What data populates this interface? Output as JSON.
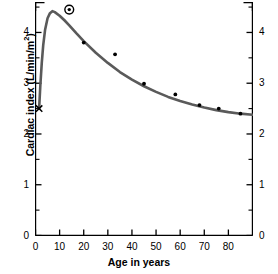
{
  "chart_data": {
    "type": "scatter",
    "title": "",
    "xlabel": "Age in years",
    "ylabel": "Cardiac index (L/min/m²)",
    "ylabel_base": "Cardiac index (L/min/m",
    "ylabel_exp": "2",
    "ylabel_tail": ")",
    "xlim": [
      0,
      90
    ],
    "ylim": [
      0,
      4.6
    ],
    "grid": false,
    "legend": "none",
    "x_ticks": [
      0,
      10,
      20,
      30,
      40,
      50,
      60,
      70,
      80
    ],
    "x_tick_labels": [
      "0",
      "10",
      "20",
      "30",
      "40",
      "50",
      "60",
      "70",
      "80"
    ],
    "x_minor_ticks": [
      5,
      15,
      25,
      35,
      45,
      55,
      65,
      75,
      85
    ],
    "y_ticks": [
      0,
      1,
      2,
      3,
      4
    ],
    "y_tick_labels": [
      "0",
      "1",
      "2",
      "3",
      "4"
    ],
    "y_minor_ticks": [
      0.5,
      1.5,
      2.5,
      3.5,
      4.5
    ],
    "right_axis_ticks": [
      0,
      1,
      2,
      3,
      4
    ],
    "right_axis_tick_labels": [
      "0",
      "1",
      "2",
      "3",
      "4"
    ],
    "series": [
      {
        "name": "Measured cardiac index",
        "marker": "filled-dot",
        "color": "#000000",
        "points": [
          {
            "x": 20,
            "y": 3.8
          },
          {
            "x": 33,
            "y": 3.57
          },
          {
            "x": 45,
            "y": 2.99
          },
          {
            "x": 58,
            "y": 2.78
          },
          {
            "x": 68,
            "y": 2.57
          },
          {
            "x": 76,
            "y": 2.5
          },
          {
            "x": 85,
            "y": 2.4
          }
        ]
      },
      {
        "name": "Birth value",
        "marker": "x-cross",
        "color": "#000000",
        "points": [
          {
            "x": 1.5,
            "y": 2.5
          }
        ]
      },
      {
        "name": "Highlighted peak value",
        "marker": "circled-dot",
        "color": "#000000",
        "points": [
          {
            "x": 14,
            "y": 4.45
          }
        ]
      }
    ],
    "fitted_curve": {
      "name": "Fitted cardiac index curve",
      "color": "#5a5a5a",
      "width": 2.6,
      "points": [
        {
          "x": 1.5,
          "y": 2.5
        },
        {
          "x": 2.0,
          "y": 2.95
        },
        {
          "x": 2.6,
          "y": 3.4
        },
        {
          "x": 3.2,
          "y": 3.75
        },
        {
          "x": 4.0,
          "y": 4.06
        },
        {
          "x": 5.0,
          "y": 4.28
        },
        {
          "x": 6.0,
          "y": 4.38
        },
        {
          "x": 7.0,
          "y": 4.42
        },
        {
          "x": 8.0,
          "y": 4.4
        },
        {
          "x": 10.0,
          "y": 4.33
        },
        {
          "x": 12.0,
          "y": 4.24
        },
        {
          "x": 14.0,
          "y": 4.14
        },
        {
          "x": 17.0,
          "y": 3.98
        },
        {
          "x": 20.0,
          "y": 3.83
        },
        {
          "x": 25.0,
          "y": 3.6
        },
        {
          "x": 30.0,
          "y": 3.4
        },
        {
          "x": 35.0,
          "y": 3.22
        },
        {
          "x": 40.0,
          "y": 3.07
        },
        {
          "x": 45.0,
          "y": 2.94
        },
        {
          "x": 50.0,
          "y": 2.83
        },
        {
          "x": 55.0,
          "y": 2.73
        },
        {
          "x": 60.0,
          "y": 2.65
        },
        {
          "x": 65.0,
          "y": 2.58
        },
        {
          "x": 70.0,
          "y": 2.52
        },
        {
          "x": 75.0,
          "y": 2.47
        },
        {
          "x": 80.0,
          "y": 2.43
        },
        {
          "x": 85.0,
          "y": 2.4
        },
        {
          "x": 90.0,
          "y": 2.38
        }
      ]
    }
  }
}
